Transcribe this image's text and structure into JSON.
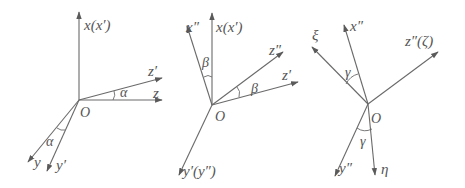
{
  "figure": {
    "panels": [
      {
        "id": "rotation-alpha",
        "origin_label": "O",
        "axes": {
          "x": "x(x′)",
          "z": "z",
          "z_prime": "z′",
          "y": "y",
          "y_prime": "y′"
        },
        "angle_label": "α"
      },
      {
        "id": "rotation-beta",
        "origin_label": "O",
        "axes": {
          "x_dprime": "x″",
          "x": "x(x′)",
          "z_dprime": "z″",
          "z_prime": "z′",
          "y": "y′(y″)"
        },
        "angle_label": "β"
      },
      {
        "id": "rotation-gamma",
        "origin_label": "O",
        "axes": {
          "xi": "ξ",
          "x_dprime": "x″",
          "z": "z″(ζ)",
          "y_dprime": "y″",
          "eta": "η"
        },
        "angle_label": "γ"
      }
    ],
    "colors": {
      "line": "#6a6a6a",
      "text": "#555555",
      "background": "#ffffff"
    }
  }
}
